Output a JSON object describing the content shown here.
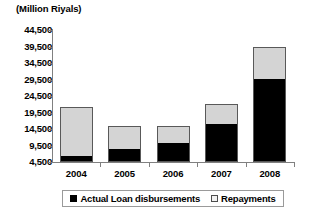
{
  "chart_data": {
    "type": "bar",
    "subtype": "stacked-bar",
    "title": "(Million Riyals)",
    "xlabel": "",
    "ylabel": "",
    "categories": [
      "2004",
      "2005",
      "2006",
      "2007",
      "2008"
    ],
    "series": [
      {
        "name": "Actual Loan disbursements",
        "color": "#000000",
        "values": [
          6000,
          8200,
          10000,
          15700,
          29300
        ]
      },
      {
        "name": "Repayments",
        "color": "#d4d4d4",
        "values": [
          15200,
          7100,
          5400,
          6300,
          10200
        ]
      }
    ],
    "totals": [
      21200,
      15300,
      15400,
      22000,
      39500
    ],
    "ylim": [
      4500,
      44500
    ],
    "yticks": [
      "4,500",
      "9,500",
      "14,500",
      "19,500",
      "24,500",
      "29,500",
      "34,500",
      "39,500",
      "44,500"
    ],
    "ytick_values": [
      4500,
      9500,
      14500,
      19500,
      24500,
      29500,
      34500,
      39500,
      44500
    ],
    "grid": false,
    "legend_position": "bottom"
  },
  "legend": {
    "entries": [
      {
        "label": "Actual Loan disbursements",
        "swatch": "black-square-icon"
      },
      {
        "label": "Repayments",
        "swatch": "light-square-icon"
      }
    ]
  }
}
